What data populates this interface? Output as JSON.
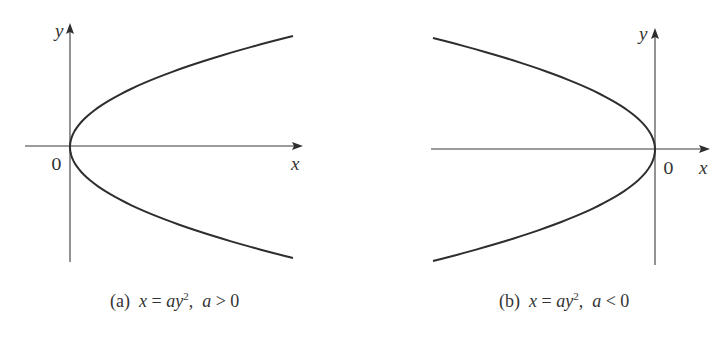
{
  "figure": {
    "panels": [
      {
        "id": "a",
        "caption_prefix": "(a)",
        "caption_eq_lhs": "x",
        "caption_eq_sign": "=",
        "caption_eq_rhs_var": "ay",
        "caption_eq_exp": "2",
        "caption_sep": ",",
        "caption_cond_var": "a",
        "caption_cond_op": ">",
        "caption_cond_val": "0",
        "x_label": "x",
        "y_label": "y",
        "origin_label": "0",
        "sign_of_a": "positive",
        "opens": "right"
      },
      {
        "id": "b",
        "caption_prefix": "(b)",
        "caption_eq_lhs": "x",
        "caption_eq_sign": "=",
        "caption_eq_rhs_var": "ay",
        "caption_eq_exp": "2",
        "caption_sep": ",",
        "caption_cond_var": "a",
        "caption_cond_op": "<",
        "caption_cond_val": "0",
        "x_label": "x",
        "y_label": "y",
        "origin_label": "0",
        "sign_of_a": "negative",
        "opens": "left"
      }
    ],
    "colors": {
      "ink": "#2e2e2e",
      "background": "#ffffff"
    }
  }
}
